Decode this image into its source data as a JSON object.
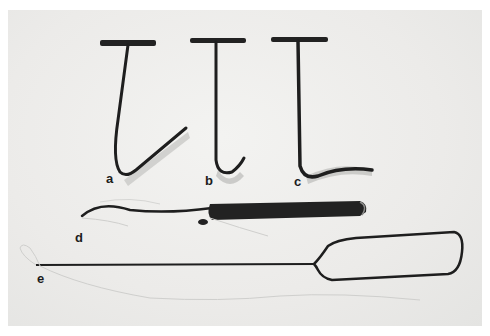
{
  "figure": {
    "labels": {
      "a": "a",
      "b": "b",
      "c": "c",
      "d": "d",
      "e": "e"
    },
    "colors": {
      "background": "#ecebe9",
      "border": "#ffffff",
      "metal": "#1e1e1e",
      "shadow": "#b9b9b7",
      "thread": "#c8c8c6"
    }
  }
}
